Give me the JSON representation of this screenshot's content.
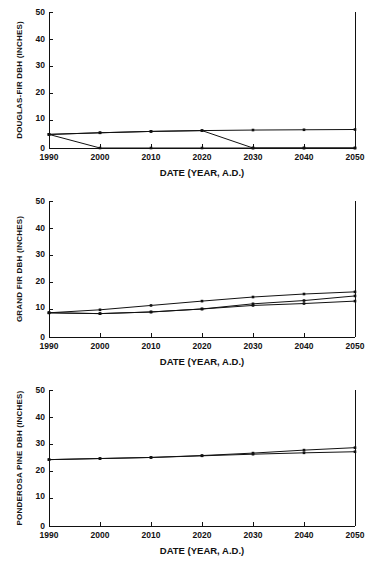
{
  "chart_data": [
    {
      "type": "line",
      "title": "",
      "panel_id": "douglas-fir",
      "xlabel": "DATE (YEAR, A.D.)",
      "ylabel": "DOUGLAS-FIR DBH (INCHES)",
      "x": [
        1990,
        2000,
        2010,
        2020,
        2030,
        2040,
        2050
      ],
      "xticklabels": [
        "1990",
        "2000",
        "2010",
        "2020",
        "2030",
        "2040",
        "2050"
      ],
      "yticks": [
        0,
        10,
        20,
        30,
        40,
        50
      ],
      "yticklabels": [
        "0",
        "10",
        "20",
        "30",
        "40",
        "50"
      ],
      "xlim": [
        1990,
        2050
      ],
      "ylim": [
        0,
        50
      ],
      "grid": false,
      "legend": "none",
      "series": [
        {
          "name": "stand-1",
          "values": [
            5.0,
            5.6,
            6.1,
            6.4,
            6.6,
            6.7,
            6.8
          ]
        },
        {
          "name": "stand-2",
          "values": [
            5.0,
            0.0,
            0.0,
            0.0,
            0.0,
            0.0,
            0.0
          ]
        },
        {
          "name": "stand-3",
          "values": [
            5.0,
            5.6,
            6.1,
            6.4,
            0.0,
            0.0,
            0.0
          ]
        }
      ]
    },
    {
      "type": "line",
      "title": "",
      "panel_id": "grand-fir",
      "xlabel": "DATE (YEAR, A.D.)",
      "ylabel": "GRAND FIR DBH (INCHES)",
      "x": [
        1990,
        2000,
        2010,
        2020,
        2030,
        2040,
        2050
      ],
      "xticklabels": [
        "1990",
        "2000",
        "2010",
        "2020",
        "2030",
        "2040",
        "2050"
      ],
      "yticks": [
        0,
        10,
        20,
        30,
        40,
        50
      ],
      "yticklabels": [
        "0",
        "10",
        "20",
        "30",
        "40",
        "50"
      ],
      "xlim": [
        1990,
        2050
      ],
      "ylim": [
        0,
        50
      ],
      "grid": false,
      "legend": "none",
      "series": [
        {
          "name": "stand-1",
          "values": [
            8.9,
            10.0,
            11.6,
            13.2,
            14.7,
            15.8,
            16.6
          ]
        },
        {
          "name": "stand-2",
          "values": [
            8.9,
            8.6,
            9.2,
            10.3,
            12.2,
            13.4,
            15.1
          ]
        },
        {
          "name": "stand-3",
          "values": [
            8.9,
            8.6,
            9.2,
            10.3,
            11.6,
            12.3,
            13.2
          ]
        }
      ]
    },
    {
      "type": "line",
      "title": "",
      "panel_id": "ponderosa-pine",
      "xlabel": "DATE (YEAR, A.D.)",
      "ylabel": "PONDEROSA PINE DBH (INCHES)",
      "x": [
        1990,
        2000,
        2010,
        2020,
        2030,
        2040,
        2050
      ],
      "xticklabels": [
        "1990",
        "2000",
        "2010",
        "2020",
        "2030",
        "2040",
        "2050"
      ],
      "yticks": [
        0,
        10,
        20,
        30,
        40,
        50
      ],
      "yticklabels": [
        "0",
        "10",
        "20",
        "30",
        "40",
        "50"
      ],
      "xlim": [
        1990,
        2050
      ],
      "ylim": [
        0,
        50
      ],
      "grid": false,
      "legend": "none",
      "series": [
        {
          "name": "stand-1",
          "values": [
            24.4,
            24.8,
            25.2,
            25.9,
            26.8,
            27.9,
            28.8
          ]
        },
        {
          "name": "stand-2",
          "values": [
            24.4,
            24.8,
            25.2,
            25.8,
            26.4,
            26.9,
            27.3
          ]
        }
      ]
    }
  ]
}
